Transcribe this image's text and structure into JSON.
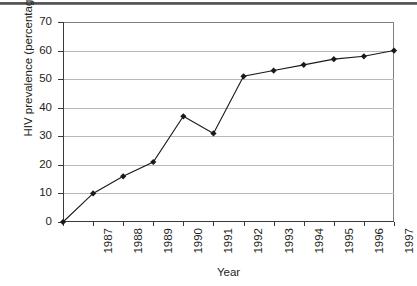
{
  "chart_data": {
    "type": "line",
    "title": "",
    "xlabel": "Year",
    "ylabel": "HIV prevalence (percentage)",
    "categories": [
      "1987",
      "1988",
      "1989",
      "1990",
      "1991",
      "1992",
      "1993",
      "1994",
      "1995",
      "1996",
      "1997",
      "1998"
    ],
    "values": [
      0,
      10,
      16,
      21,
      37,
      31,
      51,
      53,
      55,
      57,
      58,
      60
    ],
    "ylim": [
      0,
      70
    ],
    "yticks": [
      "0",
      "10",
      "20",
      "30",
      "40",
      "50",
      "60",
      "70"
    ],
    "ytick_values": [
      0,
      10,
      20,
      30,
      40,
      50,
      60,
      70
    ],
    "grid": "horizontal",
    "legend": "none",
    "series": [
      {
        "name": "HIV prevalence",
        "values": [
          0,
          10,
          16,
          21,
          37,
          31,
          51,
          53,
          55,
          57,
          58,
          60
        ],
        "marker": "diamond",
        "line_color": "#1a1a1a",
        "marker_color": "#1a1a1a"
      }
    ],
    "colors": {
      "line": "#1a1a1a",
      "marker": "#1a1a1a",
      "gridline": "#b9b9b9",
      "axis": "#3a3a3a",
      "frame": "#808080",
      "text": "#231f20",
      "background": "#ffffff"
    }
  }
}
